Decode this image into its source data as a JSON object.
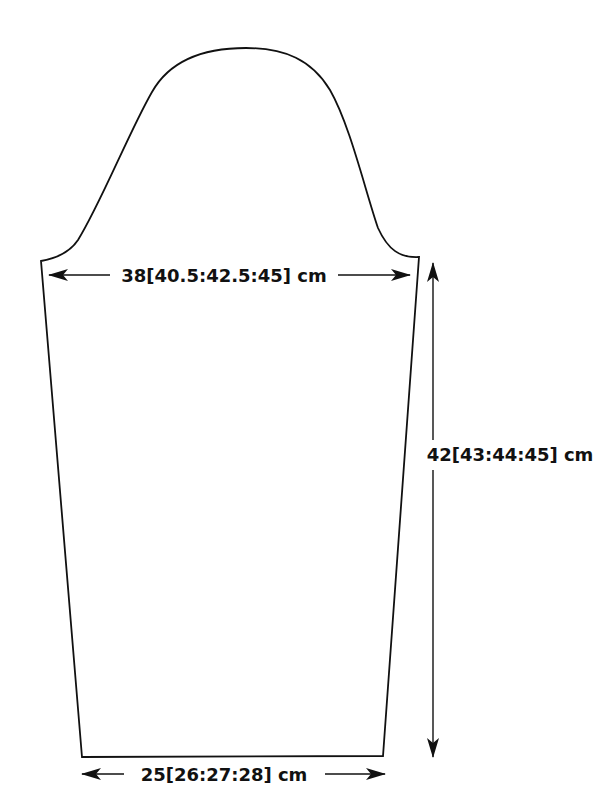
{
  "diagram": {
    "colors": {
      "line": "#111111",
      "background": "#ffffff"
    },
    "measurements": {
      "upper_width": {
        "label": "38[40.5:42.5:45] cm",
        "direction": "horizontal"
      },
      "length": {
        "label": "42[43:44:45] cm",
        "direction": "vertical"
      },
      "cuff_width": {
        "label": "25[26:27:28] cm",
        "direction": "horizontal"
      }
    }
  }
}
